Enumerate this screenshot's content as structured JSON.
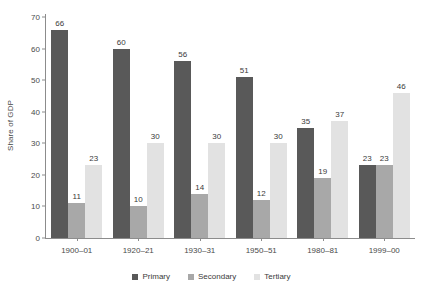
{
  "chart_data": {
    "type": "bar",
    "title": "",
    "subtitle": "",
    "xlabel": "",
    "ylabel": "Share of GDP",
    "ylim": [
      0,
      70
    ],
    "yticks": [
      0,
      10,
      20,
      30,
      40,
      50,
      60,
      70
    ],
    "grid": false,
    "legend_position": "bottom",
    "categories": [
      "1900–01",
      "1920–21",
      "1930–31",
      "1950–51",
      "1980–81",
      "1999–00"
    ],
    "series": [
      {
        "name": "Primary",
        "color": "#595959",
        "values": [
          66,
          60,
          56,
          51,
          35,
          23
        ]
      },
      {
        "name": "Secondary",
        "color": "#a8a8a8",
        "values": [
          11,
          10,
          14,
          12,
          19,
          23
        ]
      },
      {
        "name": "Tertiary",
        "color": "#e2e2e2",
        "values": [
          23,
          30,
          30,
          30,
          37,
          46
        ]
      }
    ],
    "data_labels": true
  }
}
